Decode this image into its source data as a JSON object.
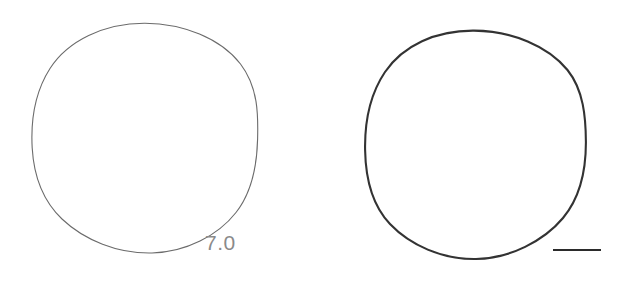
{
  "figure": {
    "background_color": "#ffffff",
    "width": 624,
    "height": 289,
    "panels": [
      {
        "name": "left-panel",
        "shape": "circle-outline",
        "center_x": 145,
        "center_y": 138,
        "radius_x": 113,
        "radius_y": 115,
        "stroke_color": "#6b6b6b",
        "stroke_width": 1.1,
        "fill": "none",
        "label": "7.0",
        "label_color": "#8a8a8a",
        "label_x": 205,
        "label_y": 232
      },
      {
        "name": "right-panel",
        "shape": "circle-outline",
        "center_x": 475,
        "center_y": 145,
        "radius_x": 110,
        "radius_y": 114,
        "stroke_color": "#333333",
        "stroke_width": 2.1,
        "fill": "none",
        "label": "",
        "scale_bar": {
          "x_start": 553,
          "x_end": 601,
          "y": 250,
          "thickness": 2.2,
          "color": "#2b2b2b",
          "label": ""
        }
      }
    ]
  }
}
